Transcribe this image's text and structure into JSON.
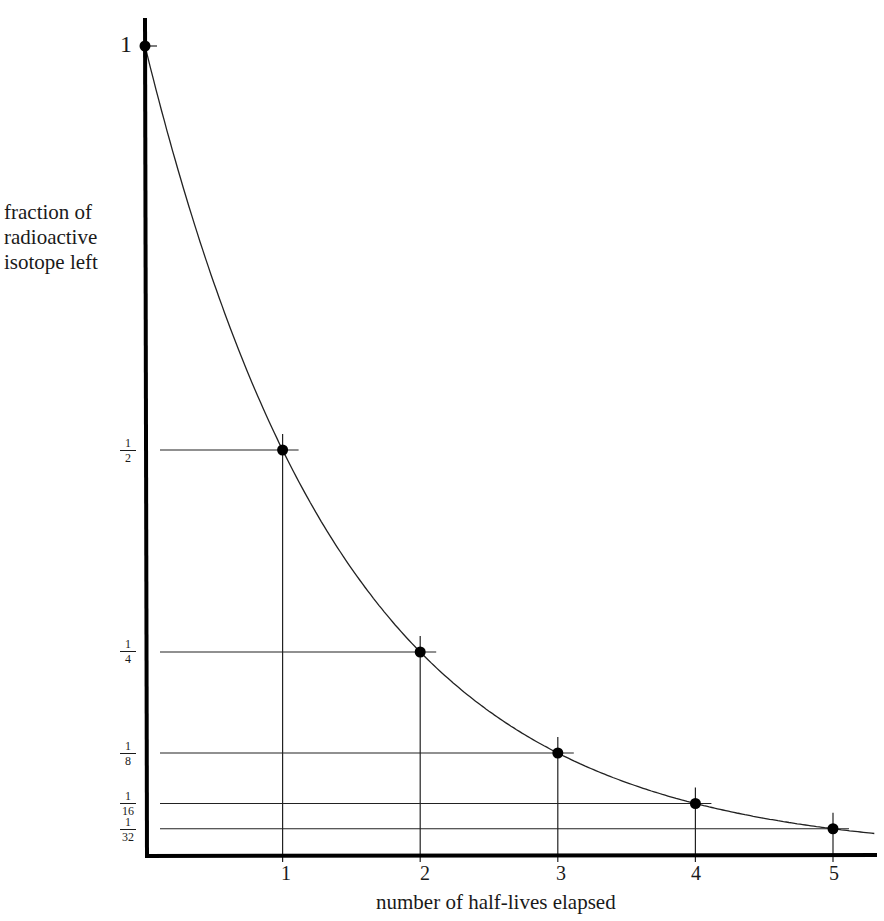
{
  "chart_data": {
    "type": "line",
    "title": "",
    "xlabel": "number of half-lives elapsed",
    "ylabel": "fraction of radioactive isotope left",
    "ylabel_lines": [
      "fraction of",
      "radioactive",
      "isotope left"
    ],
    "x": [
      0,
      1,
      2,
      3,
      4,
      5
    ],
    "values": [
      1,
      0.5,
      0.25,
      0.125,
      0.0625,
      0.03125
    ],
    "x_tick_labels": [
      "1",
      "2",
      "3",
      "4",
      "5"
    ],
    "y_tick_labels": [
      {
        "label": "1",
        "value": 1
      },
      {
        "label": "1/2",
        "num": "1",
        "den": "2",
        "value": 0.5
      },
      {
        "label": "1/4",
        "num": "1",
        "den": "4",
        "value": 0.25
      },
      {
        "label": "1/8",
        "num": "1",
        "den": "8",
        "value": 0.125
      },
      {
        "label": "1/16",
        "num": "1",
        "den": "16",
        "value": 0.0625
      },
      {
        "label": "1/32",
        "num": "1",
        "den": "32",
        "value": 0.03125
      }
    ],
    "xlim": [
      0,
      5.3
    ],
    "ylim": [
      0,
      1
    ],
    "grid": false,
    "markers": "filled-circle with crosshair guide lines to axes",
    "curve": "exponential decay y = (1/2)^x",
    "colors": {
      "line": "#111111",
      "background": "#ffffff"
    }
  }
}
